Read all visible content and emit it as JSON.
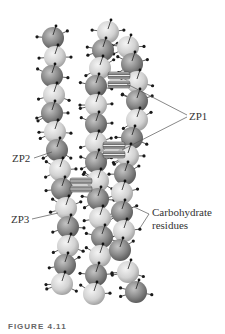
{
  "figure": {
    "labels": {
      "zp1": "ZP1",
      "zp2": "ZP2",
      "zp3": "ZP3",
      "carbohydrate_line1": "Carbohydrate",
      "carbohydrate_line2": "residues"
    },
    "caption": "FIGURE 4.11",
    "colors": {
      "light_sphere": "#d4d4d4",
      "dark_sphere": "#8a8a8a",
      "residue": "#1a1a1a",
      "leader_line": "#555555",
      "crosslink": "#777777"
    },
    "filaments": [
      {
        "name": "left-filament",
        "spheres": [
          {
            "x": 53,
            "y": 38,
            "t": "d"
          },
          {
            "x": 55,
            "y": 57,
            "t": "l"
          },
          {
            "x": 52,
            "y": 76,
            "t": "d"
          },
          {
            "x": 54,
            "y": 95,
            "t": "l"
          },
          {
            "x": 52,
            "y": 113,
            "t": "d"
          },
          {
            "x": 55,
            "y": 132,
            "t": "l"
          },
          {
            "x": 57,
            "y": 150,
            "t": "d"
          },
          {
            "x": 60,
            "y": 170,
            "t": "l"
          },
          {
            "x": 62,
            "y": 189,
            "t": "d"
          },
          {
            "x": 66,
            "y": 208,
            "t": "l"
          },
          {
            "x": 68,
            "y": 227,
            "t": "d"
          },
          {
            "x": 68,
            "y": 246,
            "t": "l"
          },
          {
            "x": 65,
            "y": 265,
            "t": "d"
          },
          {
            "x": 62,
            "y": 284,
            "t": "l"
          }
        ]
      },
      {
        "name": "middle-filament",
        "spheres": [
          {
            "x": 108,
            "y": 32,
            "t": "l"
          },
          {
            "x": 103,
            "y": 50,
            "t": "d"
          },
          {
            "x": 100,
            "y": 68,
            "t": "l"
          },
          {
            "x": 96,
            "y": 86,
            "t": "d"
          },
          {
            "x": 96,
            "y": 105,
            "t": "l"
          },
          {
            "x": 96,
            "y": 124,
            "t": "d"
          },
          {
            "x": 96,
            "y": 143,
            "t": "l"
          },
          {
            "x": 96,
            "y": 162,
            "t": "d"
          },
          {
            "x": 98,
            "y": 181,
            "t": "l"
          },
          {
            "x": 98,
            "y": 199,
            "t": "d"
          },
          {
            "x": 100,
            "y": 218,
            "t": "l"
          },
          {
            "x": 102,
            "y": 237,
            "t": "d"
          },
          {
            "x": 100,
            "y": 256,
            "t": "l"
          },
          {
            "x": 96,
            "y": 275,
            "t": "d"
          },
          {
            "x": 94,
            "y": 294,
            "t": "l"
          }
        ]
      },
      {
        "name": "right-filament",
        "spheres": [
          {
            "x": 128,
            "y": 47,
            "t": "l"
          },
          {
            "x": 132,
            "y": 64,
            "t": "d"
          },
          {
            "x": 137,
            "y": 82,
            "t": "l"
          },
          {
            "x": 137,
            "y": 101,
            "t": "d"
          },
          {
            "x": 137,
            "y": 120,
            "t": "l"
          },
          {
            "x": 132,
            "y": 138,
            "t": "d"
          },
          {
            "x": 128,
            "y": 156,
            "t": "l"
          },
          {
            "x": 125,
            "y": 174,
            "t": "d"
          },
          {
            "x": 122,
            "y": 193,
            "t": "l"
          },
          {
            "x": 122,
            "y": 212,
            "t": "d"
          },
          {
            "x": 124,
            "y": 231,
            "t": "l"
          },
          {
            "x": 120,
            "y": 250,
            "t": "d"
          },
          {
            "x": 128,
            "y": 272,
            "t": "l"
          },
          {
            "x": 136,
            "y": 292,
            "t": "d"
          }
        ]
      }
    ],
    "crosslinks": [
      {
        "name": "zp1-crosslink-upper",
        "x": 108,
        "y": 72,
        "w": 22,
        "h": 16
      },
      {
        "name": "zp1-crosslink-lower",
        "x": 103,
        "y": 142,
        "w": 22,
        "h": 16
      },
      {
        "name": "zp2-crosslink",
        "x": 70,
        "y": 178,
        "w": 22,
        "h": 14
      }
    ]
  }
}
